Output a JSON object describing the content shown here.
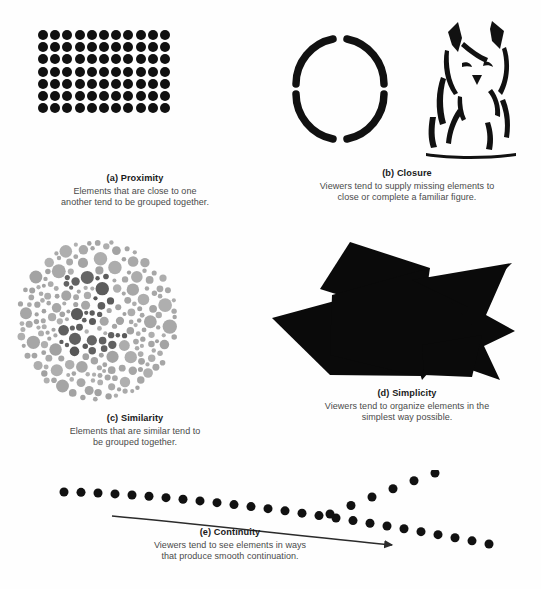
{
  "page": {
    "background_color": "#fefefe",
    "width": 541,
    "height": 589
  },
  "colors": {
    "ink": "#111111",
    "title_text": "#1a1a1a",
    "body_text": "#4a4a4a",
    "similarity_light_dot": "#a9a9a9",
    "similarity_dark_dot": "#5e5e5e",
    "arrow_stroke": "#2b2b2b"
  },
  "panels": [
    {
      "key": "proximity",
      "label": "(a) Proximity",
      "body": "Elements that are close to one\nanother tend to be grouped together.",
      "body_line1": "Elements that are close to one",
      "body_line2": "another tend to be grouped together.",
      "figure": "dot-grid",
      "grid": {
        "columns": 11,
        "rows": 7,
        "dot_diameter_px": 10,
        "gap_px": 2.2
      }
    },
    {
      "key": "closure",
      "label": "(b) Closure",
      "body": "Viewers tend to supply missing elements to\nclose or complete a familiar figure.",
      "body_line1": "Viewers tend to supply missing elements to",
      "body_line2": "close or complete a familiar figure.",
      "figure": "broken-circle-and-cat",
      "broken_circle": {
        "arc_count": 4,
        "gap_positions_deg": [
          0,
          90,
          180,
          270
        ],
        "stroke_width_px": 7
      }
    },
    {
      "key": "similarity",
      "label": "(c) Similarity",
      "body": "Elements that are similar tend to\nbe grouped together.",
      "body_line1": "Elements that are similar tend to",
      "body_line2": "be grouped together.",
      "figure": "ishihara-plate",
      "hidden_numeral": "2"
    },
    {
      "key": "simplicity",
      "label": "(d) Simplicity",
      "body": "Viewers tend to organize elements in the\nsimplest way possible.",
      "body_line1": "Viewers tend to organize elements in the",
      "body_line2": "simplest way possible.",
      "figure": "overlapping-black-polygons"
    },
    {
      "key": "continuity",
      "label": "(e) Continuity",
      "body": "Viewers tend to see elements in ways\nthat produce smooth continuation.",
      "body_line1": "Viewers tend to see elements in ways",
      "body_line2": "that produce smooth continuation.",
      "figure": "two-crossing-dot-paths-with-arrow",
      "dot_diameter_px": 9
    }
  ]
}
